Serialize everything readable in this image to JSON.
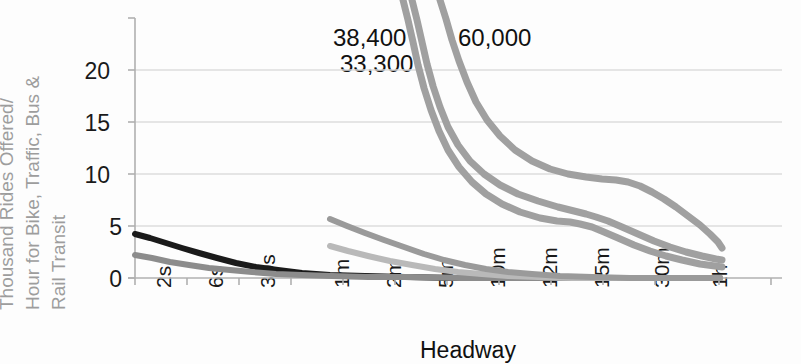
{
  "chart_data": {
    "type": "line",
    "title": "",
    "xlabel": "Headway",
    "ylabel": "Thousand Rides Offered/Hour for Bike, Traffic, Bus & Rail Transit",
    "ylabel_lines": [
      "Thousand Rides Offered/",
      "Hour for Bike, Traffic, Bus &",
      "Rail Transit"
    ],
    "grid": true,
    "legend": "none",
    "ylim": [
      0,
      23.5
    ],
    "yticks": [
      0,
      5,
      10,
      15,
      20
    ],
    "ytick_labels": [
      "0",
      "5",
      "10",
      "15",
      "20"
    ],
    "xticks": [
      "2s",
      "6s",
      "30s",
      "1m",
      "2m",
      "5m",
      "10m",
      "12m",
      "15m",
      "30m",
      "1h"
    ],
    "xtick_labels": [
      "2s",
      "6s",
      "30s",
      "1m",
      "2m",
      "5m",
      "10m",
      "12m",
      "15m",
      "30m",
      "1h"
    ],
    "annotations": [
      {
        "text": "38,400",
        "x_px": 333,
        "y_px": 24
      },
      {
        "text": "33,300",
        "x_px": 340,
        "y_px": 50
      },
      {
        "text": "60,000",
        "x_px": 458,
        "y_px": 24
      }
    ],
    "series": [
      {
        "name": "bike",
        "color": "#1a1a1a",
        "width": 6,
        "points_px": "135,234 150,238 166,243 182,248 199,253 217,258 236,263 256,267 278,270 302,273 330,275 365,276 405,277 455,278 510,278 570,278 640,278 720,278"
      },
      {
        "name": "traffic",
        "color": "#8c8c8c",
        "width": 6,
        "points_px": "135,255 152,258 170,262 189,265 209,268 230,270 252,272 276,274 302,275 332,276 368,277 410,277 460,278 520,278 590,278 660,278 720,278"
      },
      {
        "name": "bus-local",
        "color": "#b9b9b9",
        "width": 6,
        "points_px": "330,246 348,251 368,256 390,261 412,265 435,269 458,272 482,274 508,276 538,277 572,278 612,278 660,278 720,278"
      },
      {
        "name": "bus-rapid",
        "color": "#9a9a9a",
        "width": 6,
        "points_px": "330,219 347,226 365,233 384,240 404,247 424,254 444,260 465,265 486,269 508,272 532,274 560,276 592,277 630,278 675,278 720,278"
      },
      {
        "name": "rail-33300",
        "color": "#a0a0a0",
        "width": 7,
        "points_px": "403,0 408,20 413,42 418,65 424,88 431,110 439,131 448,150 459,167 472,182 486,194 502,204 520,212 540,218 557,221 570,222 580,224 592,227 604,232 618,238 634,245 650,251 666,256 682,260 700,264 715,266 722,267"
      },
      {
        "name": "rail-38400",
        "color": "#a0a0a0",
        "width": 7,
        "points_px": "412,0 417,20 422,42 427,64 433,86 440,107 448,127 458,145 470,161 484,174 500,185 518,194 538,201 558,207 574,211 586,214 596,217 608,221 622,227 638,234 654,241 670,247 686,252 702,256 716,259 722,260"
      },
      {
        "name": "rail-60000",
        "color": "#a0a0a0",
        "width": 7,
        "points_px": "440,0 446,19 452,40 459,61 467,82 476,102 487,120 500,136 515,150 532,161 550,169 568,174 586,177 602,179 616,180 628,182 640,186 652,192 664,199 676,207 688,216 700,225 710,234 718,242 722,248"
      }
    ]
  },
  "axes": {
    "plot_left_px": 135,
    "plot_right_px": 782,
    "plot_top_px": 18,
    "plot_bottom_px": 278,
    "gridline_color": "#d8d8d8",
    "axis_color": "#a8a8a8",
    "tick_spacing_px": 52,
    "ytick_y_px": [
      278,
      226,
      174,
      122,
      70
    ],
    "xtick_x_px": [
      152,
      204,
      256,
      330,
      382,
      434,
      486,
      538,
      590,
      650,
      708
    ]
  }
}
